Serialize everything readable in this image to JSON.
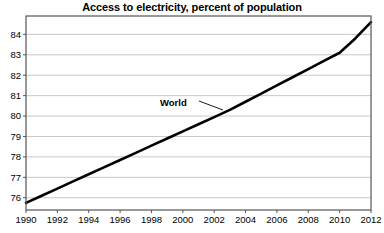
{
  "chart_data": {
    "type": "line",
    "title": "Access to electricity, percent of population",
    "xlabel": "",
    "ylabel": "",
    "xlim": [
      1990,
      2012
    ],
    "ylim": [
      75.4,
      84.9
    ],
    "grid": true,
    "legend_position": "inline-annotation",
    "x": [
      1990,
      1991,
      1992,
      1993,
      1994,
      1995,
      1996,
      1997,
      1998,
      1999,
      2000,
      2001,
      2002,
      2003,
      2004,
      2005,
      2006,
      2007,
      2008,
      2009,
      2010,
      2011,
      2012
    ],
    "series": [
      {
        "name": "World",
        "values": [
          75.75,
          76.1,
          76.45,
          76.8,
          77.15,
          77.5,
          77.85,
          78.2,
          78.55,
          78.9,
          79.25,
          79.6,
          79.95,
          80.3,
          80.7,
          81.1,
          81.5,
          81.9,
          82.3,
          82.7,
          83.1,
          83.8,
          84.6
        ]
      }
    ],
    "xticks": [
      1990,
      1992,
      1994,
      1996,
      1998,
      2000,
      2002,
      2004,
      2006,
      2008,
      2010,
      2012
    ],
    "xtick_labels": [
      "1990",
      "1992",
      "1994",
      "1996",
      "1998",
      "2000",
      "2002",
      "2004",
      "2006",
      "2008",
      "2010",
      "2012"
    ],
    "yticks": [
      76,
      77,
      78,
      79,
      80,
      81,
      82,
      83,
      84
    ],
    "ytick_labels": [
      "76",
      "77",
      "78",
      "79",
      "80",
      "81",
      "82",
      "83",
      "84"
    ],
    "annotations": [
      {
        "text": "World",
        "label_x": 160,
        "label_y": 106,
        "leader_from_x": 199,
        "leader_from_y": 101,
        "leader_to_x": 223,
        "leader_to_y": 110
      }
    ],
    "colors": {
      "line": "#000000",
      "grid": "#c8c8c8",
      "frame": "#555555",
      "background": "#ffffff",
      "text": "#000000"
    },
    "line_width": 2.6,
    "plot_area": {
      "left": 26,
      "top": 16,
      "right": 371,
      "bottom": 210
    }
  }
}
